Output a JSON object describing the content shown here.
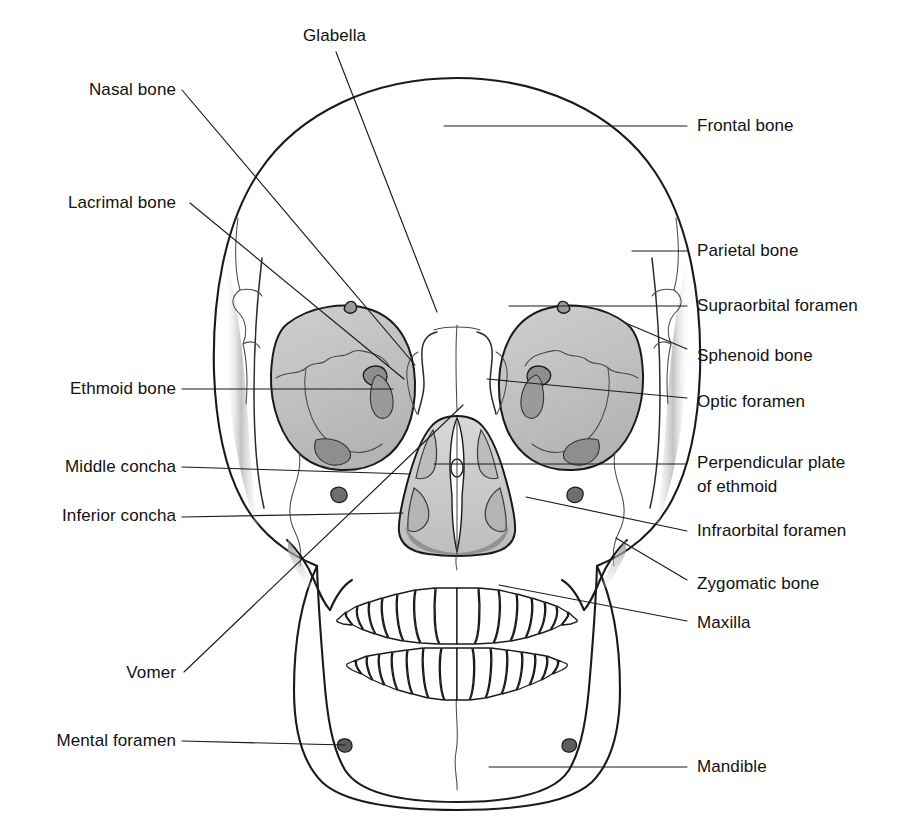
{
  "figure": {
    "background_color": "#ffffff",
    "ink_color": "#1a1a1a",
    "bone_fill": "#ffffff",
    "orbit_fill": "#c4c4c4",
    "shadow_fill": "#9a9a9a",
    "nasal_fill": "#cfcfcf"
  },
  "labels_left": [
    {
      "id": "nasal-bone",
      "text": "Nasal bone",
      "x": 176,
      "y": 95
    },
    {
      "id": "lacrimal-bone",
      "text": "Lacrimal bone",
      "x": 176,
      "y": 208
    },
    {
      "id": "ethmoid-bone",
      "text": "Ethmoid bone",
      "x": 176,
      "y": 394
    },
    {
      "id": "middle-concha",
      "text": "Middle concha",
      "x": 176,
      "y": 472
    },
    {
      "id": "inferior-concha",
      "text": "Inferior concha",
      "x": 176,
      "y": 521
    },
    {
      "id": "vomer",
      "text": "Vomer",
      "x": 176,
      "y": 678
    },
    {
      "id": "mental-foramen",
      "text": "Mental foramen",
      "x": 176,
      "y": 746
    }
  ],
  "labels_top": [
    {
      "id": "glabella",
      "text": "Glabella",
      "x": 303,
      "y": 41
    }
  ],
  "labels_right": [
    {
      "id": "frontal-bone",
      "text": "Frontal bone",
      "x": 697,
      "y": 131
    },
    {
      "id": "parietal-bone",
      "text": "Parietal bone",
      "x": 697,
      "y": 256
    },
    {
      "id": "supraorbital-foramen",
      "text": "Supraorbital foramen",
      "x": 697,
      "y": 311
    },
    {
      "id": "sphenoid-bone",
      "text": "Sphenoid bone",
      "x": 697,
      "y": 361
    },
    {
      "id": "optic-foramen",
      "text": "Optic foramen",
      "x": 697,
      "y": 407
    },
    {
      "id": "perpendicular-plate",
      "text": "Perpendicular plate",
      "x": 697,
      "y": 468
    },
    {
      "id": "perpendicular-plate-2",
      "text": "of ethmoid",
      "x": 697,
      "y": 492
    },
    {
      "id": "infraorbital-foramen",
      "text": "Infraorbital foramen",
      "x": 697,
      "y": 536
    },
    {
      "id": "zygomatic-bone",
      "text": "Zygomatic bone",
      "x": 697,
      "y": 589
    },
    {
      "id": "maxilla",
      "text": "Maxilla",
      "x": 697,
      "y": 628
    },
    {
      "id": "mandible",
      "text": "Mandible",
      "x": 697,
      "y": 772
    }
  ],
  "leaders": [
    {
      "id": "leader-glabella",
      "d": "M 336 52 L 437 312"
    },
    {
      "id": "leader-nasal-bone",
      "d": "M 182 90 L 415 365"
    },
    {
      "id": "leader-lacrimal-bone",
      "d": "M 190 203 L 404 379"
    },
    {
      "id": "leader-ethmoid-bone",
      "d": "M 182 389 L 393 389"
    },
    {
      "id": "leader-middle-concha",
      "d": "M 182 467 L 410 474"
    },
    {
      "id": "leader-inferior-concha",
      "d": "M 182 517 L 403 513"
    },
    {
      "id": "leader-vomer",
      "d": "M 184 672 L 463 405"
    },
    {
      "id": "leader-mental-foramen",
      "d": "M 182 741 L 345 745"
    },
    {
      "id": "leader-frontal-bone",
      "d": "M 687 126 L 444 126"
    },
    {
      "id": "leader-parietal-bone",
      "d": "M 687 251 L 632 251"
    },
    {
      "id": "leader-supraorbital-foramen",
      "d": "M 687 306 L 509 306"
    },
    {
      "id": "leader-sphenoid-bone",
      "d": "M 687 349 L 628 324"
    },
    {
      "id": "leader-optic-foramen",
      "d": "M 687 398 L 487 379"
    },
    {
      "id": "leader-perpendicular-plate",
      "d": "M 687 464 L 434 464"
    },
    {
      "id": "leader-infraorbital-foramen",
      "d": "M 687 531 L 526 497"
    },
    {
      "id": "leader-zygomatic-bone",
      "d": "M 687 580 L 616 538"
    },
    {
      "id": "leader-maxilla",
      "d": "M 687 621 L 499 585"
    },
    {
      "id": "leader-mandible",
      "d": "M 687 767 L 489 767"
    }
  ]
}
